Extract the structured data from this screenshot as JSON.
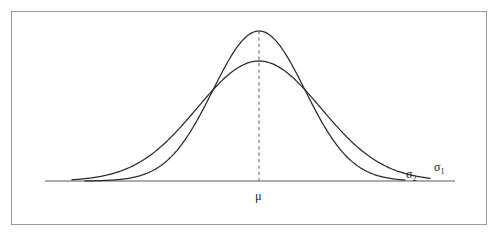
{
  "figure": {
    "name": "normal-distribution-comparison",
    "frame": {
      "border_color": "#9a9a9a",
      "background_color": "#ffffff"
    },
    "labels": {
      "mean_symbol": "μ",
      "sigma_wide_symbol": "σ",
      "sigma_wide_subscript": "1",
      "sigma_narrow_symbol": "σ",
      "sigma_narrow_subscript": "2"
    },
    "colors": {
      "curve": "#2b2b2b",
      "axis": "#5a5a5a",
      "dashed_mean_line": "#6b6b6b",
      "text": "#1e1e1e"
    }
  },
  "chart_data": {
    "type": "line",
    "title": "",
    "subtitle": "",
    "xlabel": "",
    "ylabel": "",
    "grid": false,
    "legend_position": "inline-right-of-curve-tails",
    "axis": {
      "baseline_y_px": 181,
      "x_start_px": 45,
      "x_end_px": 455,
      "xlim_px": [
        45,
        455
      ],
      "tick_labels": [
        "μ"
      ],
      "tick_positions_px": [
        259
      ]
    },
    "annotations": [
      {
        "text": "μ",
        "meaning": "shared mean of both distributions",
        "x_px": 259,
        "y_px": 196,
        "anchor": "below-axis-center"
      },
      {
        "text": "σ₂",
        "meaning": "label for the narrow tall curve",
        "x_px": 412,
        "y_px": 174,
        "anchor": "right-tail-inner"
      },
      {
        "text": "σ₁",
        "meaning": "label for the wide flat curve",
        "x_px": 440,
        "y_px": 167,
        "anchor": "right-tail-outer"
      }
    ],
    "mean_line": {
      "style": "dashed",
      "x_px": 259,
      "y_top_px": 31,
      "y_bottom_px": 181
    },
    "crossing_points_px": [
      {
        "x": 208,
        "y": 88
      },
      {
        "x": 310,
        "y": 88
      }
    ],
    "series": [
      {
        "name": "σ₁",
        "description": "wider, flatter normal curve (larger standard deviation)",
        "mean_px": 259,
        "peak_y_px": 61,
        "amplitude_px": 120,
        "sigma_px": 62,
        "x_start_px": 72,
        "x_end_px": 430,
        "x": [
          72,
          92,
          112,
          132,
          152,
          172,
          192,
          212,
          232,
          252,
          259,
          266,
          286,
          306,
          326,
          346,
          366,
          386,
          406,
          430
        ],
        "values_y_px": [
          169,
          165,
          159,
          150,
          138,
          123,
          105,
          87,
          71,
          62,
          61,
          62,
          71,
          87,
          105,
          123,
          138,
          150,
          159,
          168
        ]
      },
      {
        "name": "σ₂",
        "description": "narrower, taller normal curve (smaller standard deviation)",
        "mean_px": 259,
        "peak_y_px": 31,
        "amplitude_px": 150,
        "sigma_px": 46,
        "x_start_px": 85,
        "x_end_px": 405,
        "x": [
          85,
          105,
          125,
          145,
          165,
          185,
          205,
          225,
          245,
          259,
          273,
          293,
          313,
          333,
          353,
          373,
          393,
          405
        ],
        "values_y_px": [
          174,
          172,
          168,
          161,
          149,
          131,
          107,
          74,
          43,
          31,
          43,
          74,
          107,
          131,
          149,
          161,
          168,
          174
        ]
      }
    ]
  }
}
